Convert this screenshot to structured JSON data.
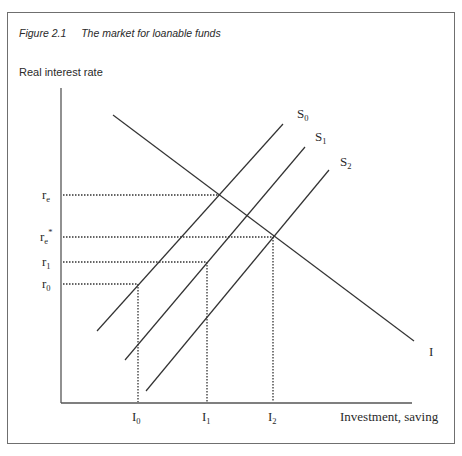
{
  "figure": {
    "number": "Figure 2.1",
    "title": "The market for loanable funds"
  },
  "axes": {
    "ylabel": "Real interest rate",
    "xlabel": "Investment, saving"
  },
  "curves": [
    {
      "name": "S0",
      "label": "S",
      "sub": "0",
      "type": "supply"
    },
    {
      "name": "S1",
      "label": "S",
      "sub": "1",
      "type": "supply"
    },
    {
      "name": "S2",
      "label": "S",
      "sub": "2",
      "type": "supply"
    },
    {
      "name": "I",
      "label": "I",
      "type": "investment demand"
    }
  ],
  "y_ticks": [
    {
      "label": "r",
      "sub": "e",
      "sup": ""
    },
    {
      "label": "r",
      "sub": "e",
      "sup": "*"
    },
    {
      "label": "r",
      "sub": "1",
      "sup": ""
    },
    {
      "label": "r",
      "sub": "0",
      "sup": ""
    }
  ],
  "x_ticks": [
    {
      "label": "I",
      "sub": "0"
    },
    {
      "label": "I",
      "sub": "1"
    },
    {
      "label": "I",
      "sub": "2"
    }
  ],
  "colors": {
    "line": "#3a3a3a",
    "frame": "#6f6f6f"
  }
}
